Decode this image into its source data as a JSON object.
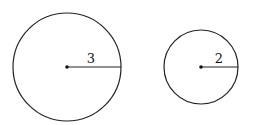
{
  "diagram": {
    "circles": [
      {
        "name": "large-circle",
        "cx": 67,
        "cy": 67,
        "r": 54,
        "radius_label": "3"
      },
      {
        "name": "small-circle",
        "cx": 201,
        "cy": 67,
        "r": 37,
        "radius_label": "2"
      }
    ],
    "colors": {
      "stroke": "#222222",
      "background": "#ffffff"
    }
  }
}
